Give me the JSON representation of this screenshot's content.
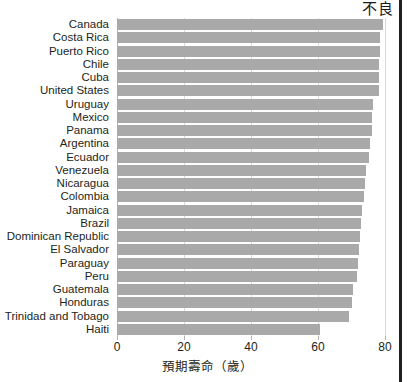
{
  "chart_data": {
    "type": "bar",
    "orientation": "horizontal",
    "title": "",
    "xlabel": "預期壽命（歲）",
    "ylabel": "",
    "xlim": [
      0,
      80
    ],
    "xticks": [
      0,
      20,
      40,
      60,
      80
    ],
    "xtick_labels": [
      "0",
      "20",
      "40",
      "60",
      "80"
    ],
    "grid": true,
    "grid_axis": "x",
    "legend": false,
    "bar_color": "#a9a9a9",
    "categories": [
      "Canada",
      "Costa Rica",
      "Puerto Rico",
      "Chile",
      "Cuba",
      "United States",
      "Uruguay",
      "Mexico",
      "Panama",
      "Argentina",
      "Ecuador",
      "Venezuela",
      "Nicaragua",
      "Colombia",
      "Jamaica",
      "Brazil",
      "Dominican Republic",
      "El Salvador",
      "Paraguay",
      "Peru",
      "Guatemala",
      "Honduras",
      "Trinidad and Tobago",
      "Haiti"
    ],
    "values": [
      79.4,
      78.5,
      78.4,
      78.3,
      78.2,
      78.1,
      76.5,
      76.2,
      76.0,
      75.6,
      75.3,
      74.2,
      74.0,
      73.6,
      73.2,
      72.8,
      72.6,
      72.1,
      72.0,
      71.6,
      70.5,
      70.2,
      69.2,
      60.6
    ]
  },
  "annotations": {
    "top_right": "不良"
  },
  "colors": {
    "bar": "#a9a9a9",
    "grid": "#d9d9d9",
    "axis": "#b3b3b3",
    "text": "#231f20",
    "rule": "#231f20"
  }
}
